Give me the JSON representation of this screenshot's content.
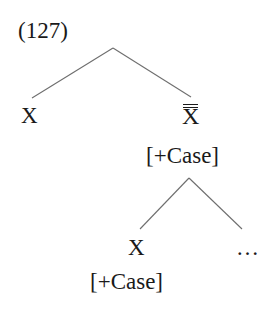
{
  "example_number": "(127)",
  "tree": {
    "root": {
      "label": "",
      "children": [
        {
          "label": "X",
          "features": ""
        },
        {
          "label": "X",
          "bar_level": 2,
          "features": "[+Case]",
          "children": [
            {
              "label": "X",
              "features": "[+Case]"
            },
            {
              "label": "…"
            }
          ]
        }
      ]
    }
  },
  "labels": {
    "left_x": "X",
    "right_xbar": "X",
    "right_feature": "[+Case]",
    "lower_x": "X",
    "lower_feature": "[+Case]",
    "ellipsis": "…"
  }
}
